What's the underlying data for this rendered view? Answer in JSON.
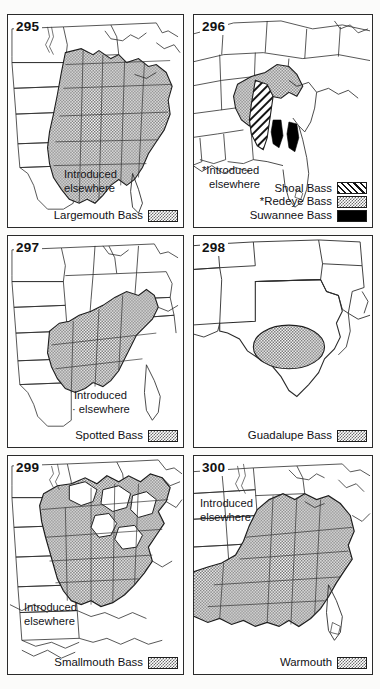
{
  "page": {
    "background_color": "#fbfbfa",
    "panel_border_color": "#2a2a2a",
    "stipple_color": "#6e6e6e",
    "solid_color": "#000000"
  },
  "panels": [
    {
      "number": "295",
      "species": "Largemouth Bass",
      "introduced_note": [
        "Introduced",
        "elsewhere"
      ],
      "legend": [
        {
          "label": "Largemouth Bass",
          "pattern": "stipple"
        }
      ]
    },
    {
      "number": "296",
      "species": "Shoal Bass",
      "introduced_note": [
        "*Introduced",
        "elsewhere"
      ],
      "legend": [
        {
          "label": "Shoal Bass",
          "pattern": "hatch"
        },
        {
          "label": "*Redeye Bass",
          "pattern": "stipple"
        },
        {
          "label": "Suwannee Bass",
          "pattern": "solid"
        }
      ]
    },
    {
      "number": "297",
      "species": "Spotted Bass",
      "introduced_note": [
        "Introduced",
        "· elsewhere"
      ],
      "legend": [
        {
          "label": "Spotted Bass",
          "pattern": "stipple"
        }
      ]
    },
    {
      "number": "298",
      "species": "Guadalupe Bass",
      "introduced_note": [],
      "legend": [
        {
          "label": "Guadalupe Bass",
          "pattern": "stipple"
        }
      ]
    },
    {
      "number": "299",
      "species": "Smallmouth Bass",
      "introduced_note": [
        "Introduced",
        "elsewhere"
      ],
      "legend": [
        {
          "label": "Smallmouth Bass",
          "pattern": "stipple"
        }
      ]
    },
    {
      "number": "300",
      "species": "Warmouth",
      "introduced_note": [
        "Introduced",
        "elsewhere"
      ],
      "legend": [
        {
          "label": "Warmouth",
          "pattern": "stipple"
        }
      ]
    }
  ]
}
